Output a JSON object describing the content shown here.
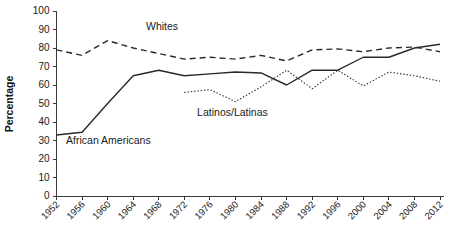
{
  "chart_data": {
    "type": "line",
    "title": "",
    "xlabel": "",
    "ylabel": "Percentage",
    "ylim": [
      0,
      100
    ],
    "ytick_step": 10,
    "grid": false,
    "legend_position": "inline-annotations",
    "categories": [
      "1952",
      "1956",
      "1960",
      "1964",
      "1968",
      "1972",
      "1976",
      "1980",
      "1984",
      "1988",
      "1992",
      "1996",
      "2000",
      "2004",
      "2008",
      "2012"
    ],
    "x": [
      1952,
      1956,
      1960,
      1964,
      1968,
      1972,
      1976,
      1980,
      1984,
      1988,
      1992,
      1996,
      2000,
      2004,
      2008,
      2012
    ],
    "ytick_labels": [
      "0",
      "10",
      "20",
      "30",
      "40",
      "50",
      "60",
      "70",
      "80",
      "90",
      "100"
    ],
    "ytick_values": [
      0,
      10,
      20,
      30,
      40,
      50,
      60,
      70,
      80,
      90,
      100
    ],
    "series": [
      {
        "name": "Whites",
        "style": "dashed",
        "color": "#2a2a2a",
        "label_x": 1966,
        "label_y": 90,
        "x": [
          1952,
          1956,
          1960,
          1964,
          1968,
          1972,
          1976,
          1980,
          1984,
          1988,
          1992,
          1996,
          2000,
          2004,
          2008,
          2012
        ],
        "values": [
          79,
          76,
          84,
          80,
          77,
          74,
          75,
          74,
          76,
          73,
          79,
          79.5,
          78,
          80,
          80.5,
          78
        ]
      },
      {
        "name": "African Americans",
        "style": "solid",
        "color": "#2a2a2a",
        "label_x": 1953.5,
        "label_y": 28,
        "x": [
          1952,
          1956,
          1960,
          1964,
          1968,
          1972,
          1976,
          1980,
          1984,
          1988,
          1992,
          1996,
          2000,
          2004,
          2008,
          2012
        ],
        "values": [
          33,
          34.5,
          50,
          65,
          68,
          65,
          66,
          67,
          66.5,
          60,
          68,
          68,
          75,
          75,
          80,
          82
        ]
      },
      {
        "name": "Latinos/Latinas",
        "style": "dotted",
        "color": "#4a4a4a",
        "label_x": 1974,
        "label_y": 43,
        "x": [
          1972,
          1976,
          1980,
          1984,
          1988,
          1992,
          1996,
          2000,
          2004,
          2008,
          2012
        ],
        "values": [
          56,
          57.5,
          51,
          59,
          68,
          58,
          68,
          59.5,
          67,
          65,
          62
        ]
      }
    ]
  },
  "axes": {
    "y_axis_title": "Percentage"
  }
}
